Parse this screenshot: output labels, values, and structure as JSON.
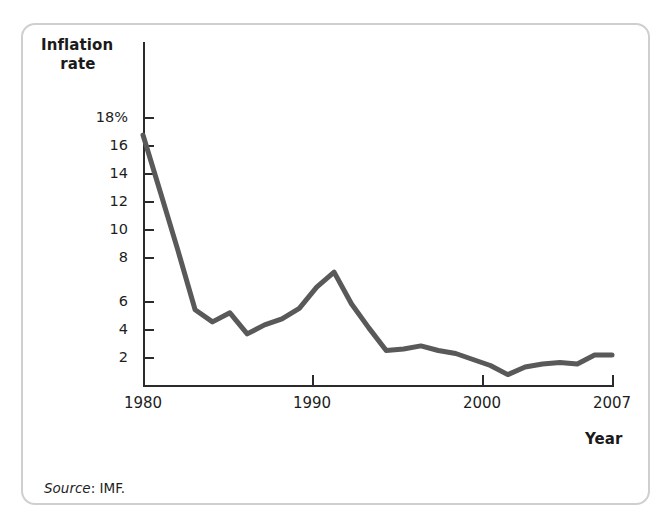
{
  "figure": {
    "y_axis_title_line1": "Inflation",
    "y_axis_title_line2": "rate",
    "x_axis_title": "Year",
    "source_label": "Source",
    "source_text": ": IMF.",
    "line_color": "#595959",
    "axis_color": "#2b2b2b",
    "frame_color": "#cfcfd1"
  },
  "chart_data": {
    "type": "line",
    "title": "Inflation rate",
    "xlabel": "Year",
    "ylabel": "Inflation rate",
    "ylim": [
      0,
      19
    ],
    "xlim": [
      1980,
      2007
    ],
    "grid": false,
    "legend": null,
    "ytick_labels": [
      "18%",
      "16",
      "14",
      "12",
      "10",
      "8",
      "6",
      "4",
      "2"
    ],
    "ytick_values": [
      18,
      16,
      14,
      12,
      10,
      8,
      6,
      4,
      2
    ],
    "xtick_labels": [
      "1980",
      "1990",
      "2000",
      "2007"
    ],
    "xtick_values": [
      1980,
      1990,
      2000,
      2007
    ],
    "series": [
      {
        "name": "Inflation rate",
        "x": [
          1980,
          1981,
          1982,
          1983,
          1984,
          1985,
          1986,
          1987,
          1988,
          1989,
          1990,
          1991,
          1992,
          1993,
          1994,
          1995,
          1996,
          1997,
          1998,
          1999,
          2000,
          2001,
          2002,
          2003,
          2004,
          2005,
          2006,
          2007
        ],
        "values": [
          16.8,
          13.0,
          9.2,
          5.2,
          4.4,
          5.0,
          3.6,
          4.2,
          4.6,
          5.3,
          6.7,
          7.7,
          5.6,
          4.0,
          2.5,
          2.6,
          2.8,
          2.5,
          2.3,
          1.9,
          1.5,
          0.9,
          1.4,
          1.6,
          1.7,
          1.6,
          2.2,
          2.2
        ]
      }
    ],
    "source": "Source: IMF."
  }
}
